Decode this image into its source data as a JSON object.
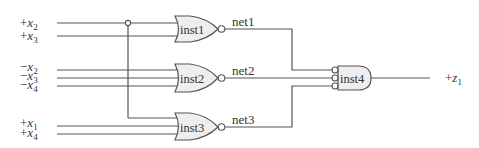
{
  "diagram": {
    "type": "logic-circuit",
    "inputs": [
      {
        "sign": "+",
        "var": "x",
        "sub": "2",
        "y": 23
      },
      {
        "sign": "+",
        "var": "x",
        "sub": "3",
        "y": 36
      },
      {
        "sign": "−",
        "var": "x",
        "sub": "2",
        "y": 70
      },
      {
        "sign": "−",
        "var": "x",
        "sub": "3",
        "y": 78
      },
      {
        "sign": "−",
        "var": "x",
        "sub": "4",
        "y": 86
      },
      {
        "sign": "+",
        "var": "x",
        "sub": "1",
        "y": 126
      },
      {
        "sign": "+",
        "var": "x",
        "sub": "4",
        "y": 134
      }
    ],
    "gates": [
      {
        "name": "inst1",
        "type": "NOR"
      },
      {
        "name": "inst2",
        "type": "NOR"
      },
      {
        "name": "inst3",
        "type": "NOR"
      },
      {
        "name": "inst4",
        "type": "AND-with-inverted-inputs"
      }
    ],
    "nets": [
      "net1",
      "net2",
      "net3"
    ],
    "output": {
      "sign": "+",
      "var": "z",
      "sub": "1"
    }
  }
}
